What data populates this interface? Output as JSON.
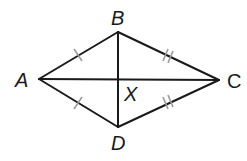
{
  "diagram": {
    "type": "geometry-kite-rhombus",
    "vertices": {
      "A": {
        "label": "A",
        "x": 39,
        "y": 79
      },
      "B": {
        "label": "B",
        "x": 118,
        "y": 32
      },
      "C": {
        "label": "C",
        "x": 219,
        "y": 80
      },
      "D": {
        "label": "D",
        "x": 118,
        "y": 127
      }
    },
    "intersection": {
      "label": "X",
      "x": 118,
      "y": 79
    },
    "segments": [
      {
        "from": "A",
        "to": "B",
        "ticks": 1
      },
      {
        "from": "B",
        "to": "C",
        "ticks": 2
      },
      {
        "from": "C",
        "to": "D",
        "ticks": 2
      },
      {
        "from": "D",
        "to": "A",
        "ticks": 1
      },
      {
        "from": "A",
        "to": "C",
        "ticks": 0,
        "role": "diagonal"
      },
      {
        "from": "B",
        "to": "D",
        "ticks": 0,
        "role": "diagonal"
      }
    ],
    "labels": {
      "A": "A",
      "B": "B",
      "C": "C",
      "D": "D",
      "X": "X"
    },
    "colors": {
      "stroke": "#1a1a1a",
      "tick": "#9a9a9a",
      "background": "#ffffff"
    }
  }
}
